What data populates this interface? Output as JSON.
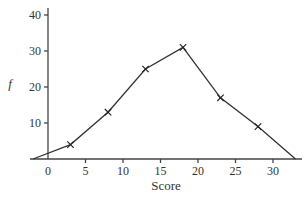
{
  "chart_data": {
    "type": "line",
    "title": "",
    "xlabel": "Score",
    "ylabel": "f",
    "x": [
      -2,
      3,
      8,
      13,
      18,
      23,
      28,
      33
    ],
    "series": [
      {
        "name": "frequency polygon",
        "values": [
          0,
          4,
          13,
          25,
          31,
          17,
          9,
          0
        ],
        "markers": [
          false,
          true,
          true,
          true,
          true,
          true,
          true,
          false
        ]
      }
    ],
    "x_ticks": [
      0,
      5,
      10,
      15,
      20,
      25,
      30
    ],
    "y_ticks": [
      10,
      20,
      30,
      40
    ],
    "xlim": [
      -2.3,
      33.5
    ],
    "ylim": [
      0,
      42
    ],
    "grid": false,
    "legend": "none",
    "marker_style": "x"
  }
}
